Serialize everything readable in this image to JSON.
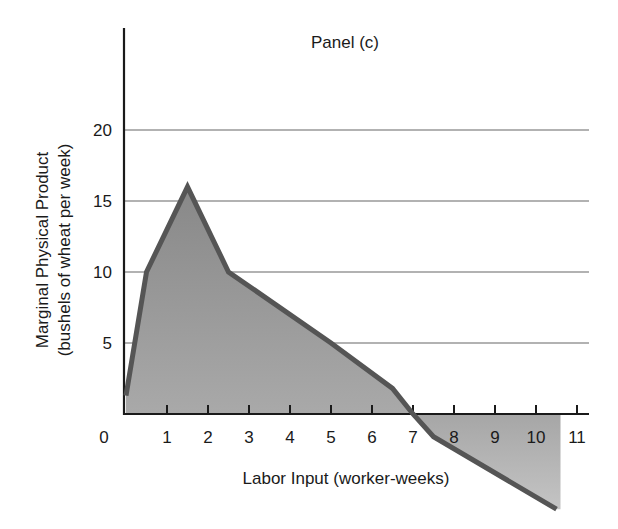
{
  "chart_data": {
    "type": "area",
    "title": "Panel (c)",
    "xlabel": "Labor Input (worker-weeks)",
    "ylabel": "Marginal Physical Product",
    "ylabel_sub": "(bushels of wheat per week)",
    "x_ticks": [
      0,
      1,
      2,
      3,
      4,
      5,
      6,
      7,
      8,
      9,
      10,
      11
    ],
    "y_ticks": [
      5,
      10,
      15,
      20
    ],
    "xlim": [
      0,
      11.5
    ],
    "ylim": [
      -7,
      25
    ],
    "grid": "horizontal at y ticks",
    "legend": "none",
    "series": [
      {
        "name": "Marginal Physical Product",
        "x": [
          0,
          0.5,
          1.5,
          2.5,
          5,
          6.5,
          7,
          7.5,
          10.5
        ],
        "y": [
          1.3,
          10,
          16,
          10,
          5,
          1.8,
          0,
          -1.6,
          -6.7
        ]
      }
    ],
    "colors": {
      "line": "#555555",
      "fill_positive": "#9a9a9a",
      "fill_negative": "#b8b8b8",
      "grid": "#999999",
      "axis": "#1a1a1a"
    }
  }
}
